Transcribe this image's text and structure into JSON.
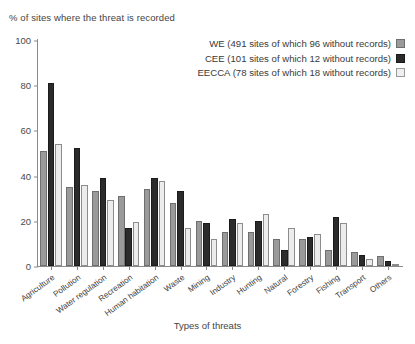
{
  "chart_data": {
    "type": "bar",
    "title": "",
    "ylabel": "% of sites where the threat is recorded",
    "xlabel": "Types of threats",
    "ylim": [
      0,
      100
    ],
    "yticks": [
      0,
      20,
      40,
      60,
      80,
      100
    ],
    "grid": false,
    "legend_position": "top-right",
    "categories": [
      "Agriculture",
      "Pollution",
      "Water regulation",
      "Recreation",
      "Human habitation",
      "Waste",
      "Mining",
      "Industry",
      "Hunting",
      "Natural",
      "Forestry",
      "Fishing",
      "Transport",
      "Others"
    ],
    "series": [
      {
        "name": "WE",
        "legend_label": "WE (491 sites of which 96 without records)",
        "color": "#9a9a9a",
        "values": [
          51,
          35,
          33,
          31,
          34,
          28,
          20,
          15,
          15,
          12,
          12,
          7,
          6,
          4.5
        ]
      },
      {
        "name": "CEE",
        "legend_label": "CEE (101 sites of which 12 without records)",
        "color": "#2b2b2b",
        "values": [
          81,
          52,
          39,
          17,
          39,
          33,
          19,
          21,
          20,
          7,
          13,
          21.5,
          5,
          2
        ]
      },
      {
        "name": "EECCA",
        "legend_label": "EECCA (78 sites of which 18 without records)",
        "color": "#ececec",
        "values": [
          54,
          36,
          29,
          19.5,
          37.5,
          17,
          12,
          19,
          23,
          17,
          14,
          19,
          3,
          0.5
        ]
      }
    ]
  }
}
